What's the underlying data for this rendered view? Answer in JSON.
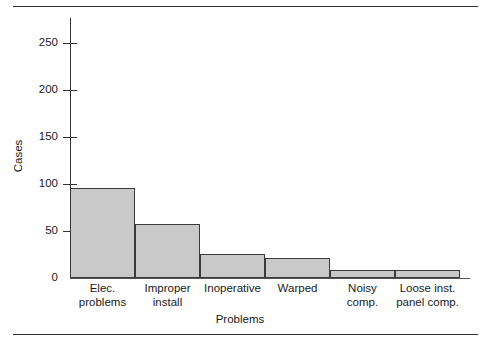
{
  "figure": {
    "background_color": "#ffffff",
    "rule_color": "#333333",
    "bar_fill_color": "#c9c9c9",
    "bar_edge_color": "#3a3a3a"
  },
  "chart_data": {
    "type": "bar",
    "title": "",
    "xlabel": "Problems",
    "ylabel": "Cases",
    "categories": [
      "Elec. problems",
      "Improper install",
      "Inoperative",
      "Warped",
      "Noisy comp.",
      "Loose inst. panel comp."
    ],
    "category_lines": [
      [
        "Elec.",
        "problems"
      ],
      [
        "Improper",
        "install"
      ],
      [
        "Inoperative"
      ],
      [
        "Warped"
      ],
      [
        "Noisy",
        "comp."
      ],
      [
        "Loose inst.",
        "panel comp."
      ]
    ],
    "values": [
      96,
      57,
      26,
      21,
      8,
      8
    ],
    "ylim": [
      0,
      275
    ],
    "yticks": [
      0,
      50,
      100,
      150,
      200,
      250
    ],
    "ytick_labels": [
      "0",
      "50",
      "100",
      "150",
      "200",
      "250"
    ],
    "grid": false,
    "legend": false
  }
}
